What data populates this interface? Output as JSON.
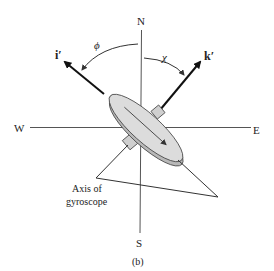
{
  "diagram": {
    "compass": {
      "north": "N",
      "south": "S",
      "west": "W",
      "east": "E"
    },
    "vectors": {
      "i_prime": "i′",
      "k_prime": "k′"
    },
    "angles": {
      "phi": "ϕ",
      "chi": "χ"
    },
    "axis_label": {
      "line1": "Axis of",
      "line2": "gyroscope"
    },
    "caption": "(b)",
    "colors": {
      "line": "#333333",
      "disc_face": "#d9d9d9",
      "disc_edge": "#b8b8b8",
      "arrow": "#111111"
    }
  }
}
